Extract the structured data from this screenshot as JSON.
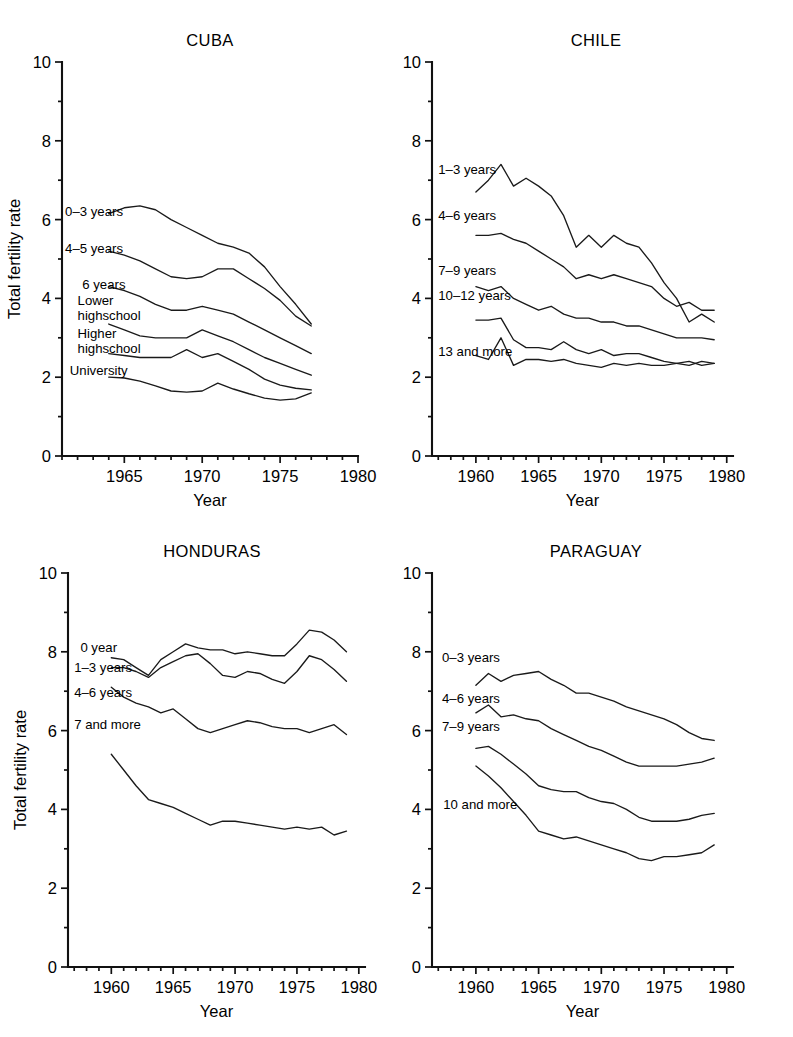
{
  "figure": {
    "background": "#ffffff",
    "ink_color": "#111111",
    "panel_count": 4
  },
  "chart_data": [
    {
      "type": "line",
      "title": "CUBA",
      "xlabel": "Year",
      "ylabel": "Total fertility rate",
      "xlim": [
        1961,
        1980
      ],
      "ylim": [
        0,
        10
      ],
      "xticks": [
        1965,
        1970,
        1975,
        1980
      ],
      "xtick_labels": [
        "1965",
        "1970",
        "1975",
        "1980"
      ],
      "yticks": [
        0,
        2,
        4,
        6,
        8,
        10
      ],
      "ytick_labels": [
        "0",
        "2",
        "4",
        "6",
        "8",
        "10"
      ],
      "minor_xtick_spacing": 1,
      "grid": false,
      "legend": "inline-left-labels",
      "series": [
        {
          "name": "0–3 years",
          "label_x": 1961.2,
          "label_y": 6.1,
          "x": [
            1964,
            1965,
            1966,
            1967,
            1968,
            1969,
            1970,
            1971,
            1972,
            1973,
            1974,
            1975,
            1976,
            1977
          ],
          "values": [
            6.15,
            6.3,
            6.35,
            6.25,
            6.0,
            5.8,
            5.6,
            5.4,
            5.3,
            5.15,
            4.8,
            4.3,
            3.85,
            3.35
          ]
        },
        {
          "name": "4–5 years",
          "label_x": 1961.2,
          "label_y": 5.15,
          "x": [
            1964,
            1965,
            1966,
            1967,
            1968,
            1969,
            1970,
            1971,
            1972,
            1973,
            1974,
            1975,
            1976,
            1977
          ],
          "values": [
            5.2,
            5.1,
            4.95,
            4.75,
            4.55,
            4.5,
            4.55,
            4.75,
            4.75,
            4.5,
            4.25,
            3.95,
            3.55,
            3.3
          ]
        },
        {
          "name": "6 years",
          "label_x": 1962.3,
          "label_y": 4.25,
          "x": [
            1964,
            1965,
            1966,
            1967,
            1968,
            1969,
            1970,
            1971,
            1972,
            1973,
            1974,
            1975,
            1976,
            1977
          ],
          "values": [
            4.3,
            4.2,
            4.05,
            3.85,
            3.7,
            3.7,
            3.8,
            3.7,
            3.6,
            3.4,
            3.2,
            3.0,
            2.8,
            2.6
          ]
        },
        {
          "name": "Lower highschool",
          "label_x": 1962.0,
          "label_y": 3.82,
          "label_lines": [
            "Lower",
            "highschool"
          ],
          "x": [
            1964,
            1965,
            1966,
            1967,
            1968,
            1969,
            1970,
            1971,
            1972,
            1973,
            1974,
            1975,
            1976,
            1977
          ],
          "values": [
            3.35,
            3.2,
            3.05,
            3.0,
            3.0,
            3.0,
            3.2,
            3.05,
            2.9,
            2.7,
            2.5,
            2.35,
            2.2,
            2.05
          ]
        },
        {
          "name": "Higher highschool",
          "label_x": 1962.0,
          "label_y": 3.0,
          "label_lines": [
            "Higher",
            "highschool"
          ],
          "x": [
            1964,
            1965,
            1966,
            1967,
            1968,
            1969,
            1970,
            1971,
            1972,
            1973,
            1974,
            1975,
            1976,
            1977
          ],
          "values": [
            2.6,
            2.55,
            2.5,
            2.5,
            2.5,
            2.7,
            2.5,
            2.6,
            2.4,
            2.2,
            1.95,
            1.8,
            1.72,
            1.68
          ]
        },
        {
          "name": "University",
          "label_x": 1961.5,
          "label_y": 2.05,
          "x": [
            1964,
            1965,
            1966,
            1967,
            1968,
            1969,
            1970,
            1971,
            1972,
            1973,
            1974,
            1975,
            1976,
            1977
          ],
          "values": [
            2.0,
            1.98,
            1.9,
            1.78,
            1.65,
            1.62,
            1.65,
            1.85,
            1.7,
            1.58,
            1.47,
            1.42,
            1.45,
            1.6
          ]
        }
      ]
    },
    {
      "type": "line",
      "title": "CHILE",
      "xlabel": "Year",
      "ylabel": "Total fertility rate",
      "xlim": [
        1956.5,
        1980.5
      ],
      "ylim": [
        0,
        10
      ],
      "xticks": [
        1960,
        1965,
        1970,
        1975,
        1980
      ],
      "xtick_labels": [
        "1960",
        "1965",
        "1970",
        "1975",
        "1980"
      ],
      "yticks": [
        0,
        2,
        4,
        6,
        8,
        10
      ],
      "ytick_labels": [
        "0",
        "2",
        "4",
        "6",
        "8",
        "10"
      ],
      "minor_xtick_spacing": 1,
      "grid": false,
      "legend": "inline-left-labels",
      "series": [
        {
          "name": "1–3 years",
          "label_x": 1957.0,
          "label_y": 7.15,
          "x": [
            1960,
            1961,
            1962,
            1963,
            1964,
            1965,
            1966,
            1967,
            1968,
            1969,
            1970,
            1971,
            1972,
            1973,
            1974,
            1975,
            1976,
            1977,
            1978,
            1979
          ],
          "values": [
            6.7,
            7.0,
            7.4,
            6.85,
            7.05,
            6.85,
            6.6,
            6.1,
            5.3,
            5.6,
            5.3,
            5.6,
            5.4,
            5.3,
            4.9,
            4.4,
            4.0,
            3.4,
            3.6,
            3.4
          ]
        },
        {
          "name": "4–6 years",
          "label_x": 1957.0,
          "label_y": 6.0,
          "x": [
            1960,
            1961,
            1962,
            1963,
            1964,
            1965,
            1966,
            1967,
            1968,
            1969,
            1970,
            1971,
            1972,
            1973,
            1974,
            1975,
            1976,
            1977,
            1978,
            1979
          ],
          "values": [
            5.6,
            5.6,
            5.65,
            5.5,
            5.4,
            5.2,
            5.0,
            4.8,
            4.5,
            4.6,
            4.5,
            4.6,
            4.5,
            4.4,
            4.3,
            4.0,
            3.8,
            3.9,
            3.7,
            3.7
          ]
        },
        {
          "name": "7–9 years",
          "label_x": 1957.0,
          "label_y": 4.6,
          "x": [
            1960,
            1961,
            1962,
            1963,
            1964,
            1965,
            1966,
            1967,
            1968,
            1969,
            1970,
            1971,
            1972,
            1973,
            1974,
            1975,
            1976,
            1977,
            1978,
            1979
          ],
          "values": [
            4.3,
            4.2,
            4.3,
            4.0,
            3.85,
            3.7,
            3.8,
            3.6,
            3.5,
            3.5,
            3.4,
            3.4,
            3.3,
            3.3,
            3.2,
            3.1,
            3.0,
            3.0,
            3.0,
            2.95
          ]
        },
        {
          "name": "10–12 years",
          "label_x": 1957.0,
          "label_y": 3.95,
          "x": [
            1960,
            1961,
            1962,
            1963,
            1964,
            1965,
            1966,
            1967,
            1968,
            1969,
            1970,
            1971,
            1972,
            1973,
            1974,
            1975,
            1976,
            1977,
            1978,
            1979
          ],
          "values": [
            3.45,
            3.45,
            3.5,
            2.95,
            2.75,
            2.75,
            2.7,
            2.9,
            2.7,
            2.6,
            2.7,
            2.55,
            2.6,
            2.6,
            2.5,
            2.4,
            2.35,
            2.3,
            2.4,
            2.35
          ]
        },
        {
          "name": "13 and more",
          "label_x": 1957.0,
          "label_y": 2.55,
          "x": [
            1960,
            1961,
            1962,
            1963,
            1964,
            1965,
            1966,
            1967,
            1968,
            1969,
            1970,
            1971,
            1972,
            1973,
            1974,
            1975,
            1976,
            1977,
            1978,
            1979
          ],
          "values": [
            2.55,
            2.45,
            3.0,
            2.3,
            2.45,
            2.45,
            2.4,
            2.45,
            2.35,
            2.3,
            2.25,
            2.35,
            2.3,
            2.35,
            2.3,
            2.3,
            2.35,
            2.4,
            2.3,
            2.35
          ]
        }
      ]
    },
    {
      "type": "line",
      "title": "HONDURAS",
      "xlabel": "Year",
      "ylabel": "Total fertility rate",
      "xlim": [
        1956.5,
        1980.5
      ],
      "ylim": [
        0,
        10
      ],
      "xticks": [
        1960,
        1965,
        1970,
        1975,
        1980
      ],
      "xtick_labels": [
        "1960",
        "1965",
        "1970",
        "1975",
        "1980"
      ],
      "yticks": [
        0,
        2,
        4,
        6,
        8,
        10
      ],
      "ytick_labels": [
        "0",
        "2",
        "4",
        "6",
        "8",
        "10"
      ],
      "minor_xtick_spacing": 1,
      "grid": false,
      "legend": "inline-left-labels",
      "series": [
        {
          "name": "0 year",
          "label_x": 1957.5,
          "label_y": 8.0,
          "x": [
            1960,
            1961,
            1962,
            1963,
            1964,
            1965,
            1966,
            1967,
            1968,
            1969,
            1970,
            1971,
            1972,
            1973,
            1974,
            1975,
            1976,
            1977,
            1978,
            1979
          ],
          "values": [
            7.85,
            7.8,
            7.6,
            7.4,
            7.8,
            8.0,
            8.2,
            8.1,
            8.05,
            8.05,
            7.95,
            8.0,
            7.95,
            7.9,
            7.9,
            8.2,
            8.55,
            8.5,
            8.3,
            8.0
          ]
        },
        {
          "name": "1–3 years",
          "label_x": 1957.0,
          "label_y": 7.5,
          "x": [
            1960,
            1961,
            1962,
            1963,
            1964,
            1965,
            1966,
            1967,
            1968,
            1969,
            1970,
            1971,
            1972,
            1973,
            1974,
            1975,
            1976,
            1977,
            1978,
            1979
          ],
          "values": [
            7.6,
            7.6,
            7.5,
            7.35,
            7.6,
            7.75,
            7.9,
            7.95,
            7.7,
            7.4,
            7.35,
            7.5,
            7.45,
            7.3,
            7.2,
            7.5,
            7.9,
            7.8,
            7.55,
            7.25
          ]
        },
        {
          "name": "4–6 years",
          "label_x": 1957.0,
          "label_y": 6.85,
          "x": [
            1960,
            1961,
            1962,
            1963,
            1964,
            1965,
            1966,
            1967,
            1968,
            1969,
            1970,
            1971,
            1972,
            1973,
            1974,
            1975,
            1976,
            1977,
            1978,
            1979
          ],
          "values": [
            7.1,
            6.85,
            6.7,
            6.6,
            6.45,
            6.55,
            6.3,
            6.05,
            5.95,
            6.05,
            6.15,
            6.25,
            6.2,
            6.1,
            6.05,
            6.05,
            5.95,
            6.05,
            6.15,
            5.9
          ]
        },
        {
          "name": "7 and more",
          "label_x": 1957.0,
          "label_y": 6.05,
          "x": [
            1960,
            1961,
            1962,
            1963,
            1964,
            1965,
            1966,
            1967,
            1968,
            1969,
            1970,
            1971,
            1972,
            1973,
            1974,
            1975,
            1976,
            1977,
            1978,
            1979
          ],
          "values": [
            5.4,
            5.0,
            4.6,
            4.25,
            4.15,
            4.05,
            3.9,
            3.75,
            3.6,
            3.7,
            3.7,
            3.65,
            3.6,
            3.55,
            3.5,
            3.55,
            3.5,
            3.55,
            3.35,
            3.45
          ]
        }
      ]
    },
    {
      "type": "line",
      "title": "PARAGUAY",
      "xlabel": "Year",
      "ylabel": "Total fertility rate",
      "xlim": [
        1956.5,
        1980.5
      ],
      "ylim": [
        0,
        10
      ],
      "xticks": [
        1960,
        1965,
        1970,
        1975,
        1980
      ],
      "xtick_labels": [
        "1960",
        "1965",
        "1970",
        "1975",
        "1980"
      ],
      "yticks": [
        0,
        2,
        4,
        6,
        8,
        10
      ],
      "ytick_labels": [
        "0",
        "2",
        "4",
        "6",
        "8",
        "10"
      ],
      "minor_xtick_spacing": 1,
      "grid": false,
      "legend": "inline-left-labels",
      "series": [
        {
          "name": "0–3 years",
          "label_x": 1957.3,
          "label_y": 7.75,
          "x": [
            1960,
            1961,
            1962,
            1963,
            1964,
            1965,
            1966,
            1967,
            1968,
            1969,
            1970,
            1971,
            1972,
            1973,
            1974,
            1975,
            1976,
            1977,
            1978,
            1979
          ],
          "values": [
            7.15,
            7.45,
            7.25,
            7.4,
            7.45,
            7.5,
            7.3,
            7.15,
            6.95,
            6.95,
            6.85,
            6.75,
            6.6,
            6.5,
            6.4,
            6.3,
            6.15,
            5.95,
            5.8,
            5.75
          ]
        },
        {
          "name": "4–6 years",
          "label_x": 1957.3,
          "label_y": 6.7,
          "x": [
            1960,
            1961,
            1962,
            1963,
            1964,
            1965,
            1966,
            1967,
            1968,
            1969,
            1970,
            1971,
            1972,
            1973,
            1974,
            1975,
            1976,
            1977,
            1978,
            1979
          ],
          "values": [
            6.45,
            6.65,
            6.35,
            6.4,
            6.3,
            6.25,
            6.05,
            5.9,
            5.75,
            5.6,
            5.5,
            5.35,
            5.2,
            5.1,
            5.1,
            5.1,
            5.1,
            5.15,
            5.2,
            5.3
          ]
        },
        {
          "name": "7–9 years",
          "label_x": 1957.3,
          "label_y": 6.0,
          "x": [
            1960,
            1961,
            1962,
            1963,
            1964,
            1965,
            1966,
            1967,
            1968,
            1969,
            1970,
            1971,
            1972,
            1973,
            1974,
            1975,
            1976,
            1977,
            1978,
            1979
          ],
          "values": [
            5.55,
            5.6,
            5.4,
            5.15,
            4.9,
            4.6,
            4.5,
            4.45,
            4.45,
            4.3,
            4.2,
            4.15,
            4.0,
            3.8,
            3.7,
            3.7,
            3.7,
            3.75,
            3.85,
            3.9
          ]
        },
        {
          "name": "10 and more",
          "label_x": 1957.4,
          "label_y": 4.0,
          "x": [
            1960,
            1961,
            1962,
            1963,
            1964,
            1965,
            1966,
            1967,
            1968,
            1969,
            1970,
            1971,
            1972,
            1973,
            1974,
            1975,
            1976,
            1977,
            1978,
            1979
          ],
          "values": [
            5.1,
            4.85,
            4.55,
            4.2,
            3.85,
            3.45,
            3.35,
            3.25,
            3.3,
            3.2,
            3.1,
            3.0,
            2.9,
            2.75,
            2.7,
            2.8,
            2.8,
            2.85,
            2.9,
            3.1
          ]
        }
      ]
    }
  ]
}
